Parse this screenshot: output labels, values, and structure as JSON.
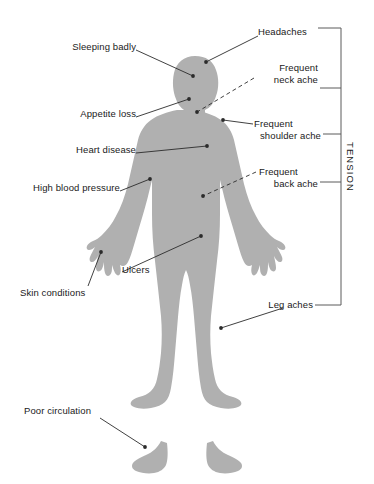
{
  "figure": {
    "body_fill_color": "#b0b0b0",
    "line_color": "#2b2b2b",
    "text_color": "#1a1a1a",
    "background_color": "#ffffff"
  },
  "bracket": {
    "label": "TENSION",
    "orientation": "vertical-right",
    "member_labels": [
      "Headaches",
      "Frequent neck ache",
      "Frequent shoulder ache",
      "Frequent back ache",
      "Leg aches"
    ]
  },
  "labels": {
    "headaches": "Headaches",
    "sleeping_badly": "Sleeping badly",
    "appetite_loss": "Appetite loss",
    "heart_disease": "Heart disease",
    "high_blood_pressure": "High blood pressure",
    "skin_conditions": "Skin conditions",
    "ulcers": "Ulcers",
    "poor_circulation": "Poor circulation",
    "frequent_neck_ache_line1": "Frequent",
    "frequent_neck_ache_line2": "neck ache",
    "frequent_shoulder_ache_line1": "Frequent",
    "frequent_shoulder_ache_line2": "shoulder ache",
    "frequent_back_ache_line1": "Frequent",
    "frequent_back_ache_line2": "back ache",
    "leg_aches": "Leg aches"
  },
  "callouts": [
    {
      "name": "headaches",
      "side": "right",
      "line_style": "solid",
      "target": "head"
    },
    {
      "name": "sleeping-badly",
      "side": "left",
      "line_style": "solid",
      "target": "head-upper"
    },
    {
      "name": "appetite-loss",
      "side": "left",
      "line_style": "solid",
      "target": "jaw"
    },
    {
      "name": "heart-disease",
      "side": "left",
      "line_style": "solid",
      "target": "chest"
    },
    {
      "name": "high-blood-pressure",
      "side": "left",
      "line_style": "solid",
      "target": "upper-arm"
    },
    {
      "name": "skin-conditions",
      "side": "left",
      "line_style": "solid",
      "target": "hand"
    },
    {
      "name": "ulcers",
      "side": "left",
      "line_style": "solid",
      "target": "abdomen"
    },
    {
      "name": "poor-circulation",
      "side": "left",
      "line_style": "solid",
      "target": "foot"
    },
    {
      "name": "frequent-neck-ache",
      "side": "right",
      "line_style": "dashed",
      "target": "neck"
    },
    {
      "name": "frequent-shoulder-ache",
      "side": "right",
      "line_style": "solid",
      "target": "shoulder"
    },
    {
      "name": "frequent-back-ache",
      "side": "right",
      "line_style": "dashed",
      "target": "lower-back"
    },
    {
      "name": "leg-aches",
      "side": "right",
      "line_style": "solid",
      "target": "thigh"
    }
  ]
}
